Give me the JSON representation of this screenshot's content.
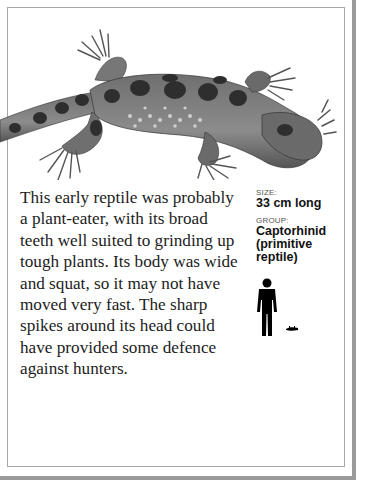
{
  "page": {
    "description": "This early reptile was probably a plant-eater, with its broad teeth well suited to grinding up tough plants. Its body was wide and squat, so it may not have moved very fast. The sharp spikes around its head could have provided some defence against hunters.",
    "facts": {
      "size_label": "SIZE:",
      "size_value": "33 cm long",
      "group_label": "GROUP:",
      "group_value": "Captorhinid (primitive reptile)"
    },
    "illustration": {
      "subject": "captorhinid-reptile",
      "scale_figures": [
        "human-silhouette",
        "reptile-silhouette"
      ]
    }
  },
  "colors": {
    "text": "#1c1c1c",
    "frame": "#a8a8a8",
    "shadow": "#9a9a9a"
  }
}
